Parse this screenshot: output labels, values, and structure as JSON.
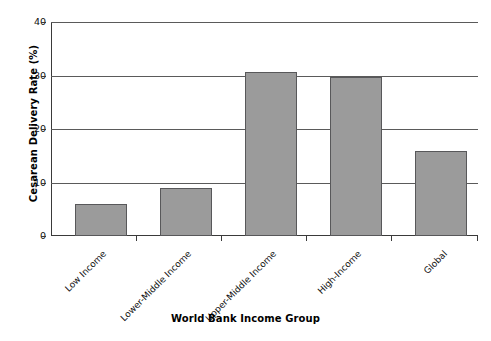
{
  "chart_data": {
    "type": "bar",
    "title": "",
    "subtitle": "",
    "xlabel": "World Bank Income Group",
    "ylabel": "Cesarean Delivery Rate (%)",
    "categories": [
      "Low Income",
      "Lower-Middle Income",
      "Upper-Middle Income",
      "High-Income",
      "Global"
    ],
    "values": [
      6.0,
      9.0,
      30.7,
      29.8,
      15.9
    ],
    "ylim": [
      0,
      40
    ],
    "yticks": [
      0,
      10,
      20,
      30,
      40
    ],
    "ytick_labels": [
      "0",
      "10",
      "20",
      "30",
      "40"
    ],
    "grid": "horizontal",
    "legend": "none",
    "bar_color": "#9b9b9b",
    "bar_edge_color": "#58585a",
    "axis_color": "#3a3a3a",
    "gridline_color": "#5a5a5a",
    "background_color": "#ffffff",
    "xlabel_rotation": -45
  }
}
